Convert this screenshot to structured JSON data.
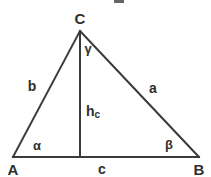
{
  "diagram": {
    "kind": "geometry-triangle-with-altitude",
    "background_color": "#ffffff",
    "stroke_color": "#3a3a3a",
    "text_color": "#2f2f2f",
    "stroke_width": 2,
    "canvas": {
      "width": 211,
      "height": 177
    },
    "vertices": {
      "A": {
        "label": "A",
        "x": 13,
        "y": 157,
        "label_x": 13,
        "label_y": 169
      },
      "B": {
        "label": "B",
        "x": 199,
        "y": 157,
        "label_x": 199,
        "label_y": 169
      },
      "C": {
        "label": "C",
        "x": 80,
        "y": 31,
        "label_x": 80,
        "label_y": 18
      }
    },
    "altitude": {
      "label": "h",
      "subscript": "c",
      "from_x": 80,
      "from_y": 31,
      "to_x": 80,
      "to_y": 157,
      "label_x": 93,
      "label_y": 112
    },
    "sides": [
      {
        "name": "side-a",
        "label": "a",
        "from": "C",
        "to": "B",
        "label_x": 153,
        "label_y": 88
      },
      {
        "name": "side-b",
        "label": "b",
        "from": "A",
        "to": "C",
        "label_x": 32,
        "label_y": 86
      },
      {
        "name": "side-c",
        "label": "c",
        "from": "A",
        "to": "B",
        "label_x": 102,
        "label_y": 169
      }
    ],
    "angles": [
      {
        "name": "angle-alpha",
        "label": "α",
        "at": "A",
        "label_x": 37,
        "label_y": 145
      },
      {
        "name": "angle-beta",
        "label": "β",
        "at": "B",
        "label_x": 169,
        "label_y": 144
      },
      {
        "name": "angle-gamma",
        "label": "γ",
        "at": "C",
        "label_x": 88,
        "label_y": 48
      }
    ]
  }
}
